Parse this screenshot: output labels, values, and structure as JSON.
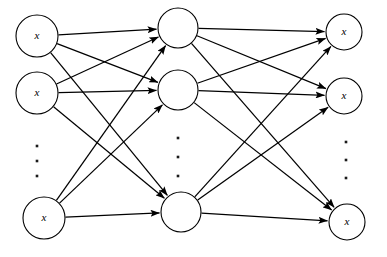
{
  "diagram": {
    "type": "neural-network-diagram",
    "background_color": "#ffffff",
    "stroke_color": "#000000",
    "layers": [
      {
        "id": "input",
        "name": "input-layer",
        "x": 37,
        "radius": 21,
        "ellipsis": {
          "x": 37,
          "dots_y": [
            146,
            161,
            176
          ]
        },
        "nodes": [
          {
            "id": "i1",
            "label": "x",
            "cx": 37,
            "cy": 36,
            "r": 21
          },
          {
            "id": "i2",
            "label": "x",
            "cx": 37,
            "cy": 93,
            "r": 21
          },
          {
            "id": "i3",
            "label": "x",
            "cx": 44,
            "cy": 218,
            "r": 21
          }
        ]
      },
      {
        "id": "hidden",
        "name": "hidden-layer",
        "x": 178,
        "radius": 20,
        "ellipsis": {
          "x": 178,
          "dots_y": [
            138,
            157,
            176
          ]
        },
        "nodes": [
          {
            "id": "h1",
            "label": "",
            "cx": 178,
            "cy": 28,
            "r": 20
          },
          {
            "id": "h2",
            "label": "",
            "cx": 178,
            "cy": 90,
            "r": 20
          },
          {
            "id": "h3",
            "label": "",
            "cx": 181,
            "cy": 212,
            "r": 20
          }
        ]
      },
      {
        "id": "output",
        "name": "output-layer",
        "x": 344,
        "radius": 17,
        "ellipsis": {
          "x": 346,
          "dots_y": [
            142,
            160,
            178
          ]
        },
        "nodes": [
          {
            "id": "o1",
            "label": "x",
            "cx": 344,
            "cy": 32,
            "r": 18
          },
          {
            "id": "o2",
            "label": "x",
            "cx": 344,
            "cy": 96,
            "r": 18
          },
          {
            "id": "o3",
            "label": "x",
            "cx": 347,
            "cy": 222,
            "r": 18
          }
        ]
      }
    ],
    "connections": [
      {
        "from": "i1",
        "to": "h1"
      },
      {
        "from": "i1",
        "to": "h2"
      },
      {
        "from": "i1",
        "to": "h3"
      },
      {
        "from": "i2",
        "to": "h1"
      },
      {
        "from": "i2",
        "to": "h2"
      },
      {
        "from": "i2",
        "to": "h3"
      },
      {
        "from": "i3",
        "to": "h1"
      },
      {
        "from": "i3",
        "to": "h2"
      },
      {
        "from": "i3",
        "to": "h3"
      },
      {
        "from": "h1",
        "to": "o1"
      },
      {
        "from": "h1",
        "to": "o2"
      },
      {
        "from": "h1",
        "to": "o3"
      },
      {
        "from": "h2",
        "to": "o1"
      },
      {
        "from": "h2",
        "to": "o2"
      },
      {
        "from": "h2",
        "to": "o3"
      },
      {
        "from": "h3",
        "to": "o1"
      },
      {
        "from": "h3",
        "to": "o2"
      },
      {
        "from": "h3",
        "to": "o3"
      }
    ]
  }
}
